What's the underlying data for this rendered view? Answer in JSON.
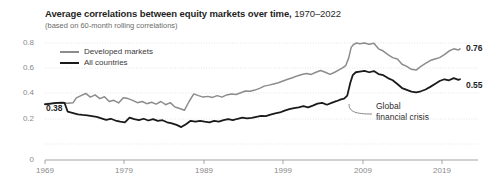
{
  "header": {
    "title_main": "Average correlations between equity markets over time,",
    "title_range": "1970–2022",
    "subtitle": "(based on 60-month rolling correlations)"
  },
  "legend": {
    "position": "top-left-inside",
    "items": [
      {
        "label": "Developed markets",
        "color": "#8c8c8c"
      },
      {
        "label": "All countries",
        "color": "#1a1a1a"
      }
    ]
  },
  "annotations": [
    {
      "name": "global-financial-crisis",
      "line1": "Global",
      "line2": "financial crisis"
    }
  ],
  "value_labels": {
    "start": "0.38",
    "end_developed": "0.76",
    "end_all": "0.55"
  },
  "axes": {
    "y_ticks": [
      "0.8",
      "0.6",
      "0.4",
      "0.2",
      "0"
    ],
    "x_ticks": [
      "1969",
      "1979",
      "1989",
      "1999",
      "2009",
      "2019"
    ]
  },
  "chart_data": {
    "type": "line",
    "title": "Average correlations between equity markets over time, 1970–2022",
    "subtitle": "(based on 60-month rolling correlations)",
    "xlabel": "",
    "ylabel": "",
    "xlim": [
      1969,
      2022
    ],
    "ylim": [
      0,
      0.8
    ],
    "grid": true,
    "legend_position": "upper left",
    "x_ticks": [
      1969,
      1979,
      1989,
      1999,
      2009,
      2019
    ],
    "y_ticks": [
      0,
      0.2,
      0.4,
      0.6,
      0.8
    ],
    "series": [
      {
        "name": "Developed markets",
        "color": "#8c8c8c",
        "x": [
          1969.0,
          1969.8,
          1970.5,
          1971.2,
          1971.9,
          1972.6,
          1973.0,
          1973.6,
          1974.2,
          1974.8,
          1975.4,
          1976.0,
          1976.6,
          1977.2,
          1977.8,
          1978.4,
          1979.0,
          1979.6,
          1980.2,
          1980.8,
          1981.4,
          1982.0,
          1982.6,
          1983.2,
          1983.8,
          1984.4,
          1985.0,
          1985.6,
          1986.2,
          1986.8,
          1987.4,
          1988.0,
          1988.6,
          1989.2,
          1989.8,
          1990.4,
          1991.0,
          1991.6,
          1992.2,
          1992.8,
          1993.4,
          1994.0,
          1994.6,
          1995.2,
          1995.8,
          1996.4,
          1997.0,
          1997.6,
          1998.2,
          1998.8,
          1999.4,
          2000.0,
          2000.6,
          2001.2,
          2001.8,
          2002.4,
          2003.0,
          2003.6,
          2004.2,
          2004.8,
          2005.4,
          2006.0,
          2006.6,
          2007.0,
          2007.4,
          2007.8,
          2008.1,
          2008.4,
          2008.8,
          2009.2,
          2009.8,
          2010.4,
          2011.0,
          2011.6,
          2012.2,
          2012.8,
          2013.4,
          2014.0,
          2014.6,
          2015.2,
          2015.8,
          2016.4,
          2017.0,
          2017.6,
          2018.2,
          2018.8,
          2019.4,
          2020.0,
          2020.6,
          2021.2,
          2021.8,
          2022.0
        ],
        "y": [
          0.385,
          0.388,
          0.392,
          0.39,
          0.388,
          0.392,
          0.425,
          0.44,
          0.455,
          0.43,
          0.445,
          0.42,
          0.432,
          0.4,
          0.408,
          0.39,
          0.425,
          0.42,
          0.408,
          0.392,
          0.4,
          0.385,
          0.395,
          0.382,
          0.4,
          0.378,
          0.392,
          0.362,
          0.352,
          0.34,
          0.4,
          0.452,
          0.44,
          0.43,
          0.435,
          0.428,
          0.44,
          0.43,
          0.445,
          0.452,
          0.448,
          0.46,
          0.472,
          0.47,
          0.478,
          0.49,
          0.505,
          0.512,
          0.52,
          0.528,
          0.54,
          0.552,
          0.562,
          0.575,
          0.585,
          0.592,
          0.585,
          0.6,
          0.612,
          0.6,
          0.585,
          0.6,
          0.618,
          0.63,
          0.645,
          0.7,
          0.77,
          0.79,
          0.8,
          0.795,
          0.8,
          0.792,
          0.798,
          0.76,
          0.745,
          0.72,
          0.7,
          0.69,
          0.655,
          0.64,
          0.62,
          0.615,
          0.64,
          0.66,
          0.68,
          0.69,
          0.7,
          0.72,
          0.745,
          0.76,
          0.752,
          0.76
        ]
      },
      {
        "name": "All countries",
        "color": "#1a1a1a",
        "x": [
          1969.0,
          1969.8,
          1970.5,
          1971.2,
          1971.5,
          1971.9,
          1972.6,
          1973.2,
          1973.8,
          1974.4,
          1975.0,
          1975.6,
          1976.2,
          1976.8,
          1977.4,
          1978.0,
          1978.6,
          1979.2,
          1979.8,
          1980.4,
          1981.0,
          1981.6,
          1982.2,
          1982.8,
          1983.4,
          1984.0,
          1984.6,
          1985.2,
          1985.8,
          1986.4,
          1987.0,
          1987.6,
          1988.2,
          1988.8,
          1989.4,
          1990.0,
          1990.6,
          1991.2,
          1991.8,
          1992.4,
          1993.0,
          1993.6,
          1994.2,
          1994.8,
          1995.4,
          1996.0,
          1996.6,
          1997.2,
          1997.8,
          1998.4,
          1999.0,
          1999.6,
          2000.2,
          2000.8,
          2001.4,
          2002.0,
          2002.6,
          2003.2,
          2003.8,
          2004.4,
          2005.0,
          2005.6,
          2006.2,
          2006.8,
          2007.2,
          2007.6,
          2008.0,
          2008.3,
          2008.7,
          2009.2,
          2009.8,
          2010.4,
          2011.0,
          2011.6,
          2012.2,
          2012.8,
          2013.4,
          2014.0,
          2014.6,
          2015.2,
          2015.8,
          2016.4,
          2017.0,
          2017.6,
          2018.2,
          2018.8,
          2019.4,
          2020.0,
          2020.6,
          2021.2,
          2021.8,
          2022.0
        ],
        "y": [
          0.38,
          0.385,
          0.39,
          0.392,
          0.39,
          0.33,
          0.32,
          0.312,
          0.308,
          0.305,
          0.3,
          0.295,
          0.285,
          0.275,
          0.282,
          0.27,
          0.262,
          0.258,
          0.29,
          0.28,
          0.272,
          0.282,
          0.27,
          0.28,
          0.268,
          0.272,
          0.258,
          0.25,
          0.24,
          0.225,
          0.245,
          0.268,
          0.262,
          0.268,
          0.262,
          0.258,
          0.268,
          0.262,
          0.272,
          0.28,
          0.272,
          0.282,
          0.29,
          0.285,
          0.288,
          0.295,
          0.302,
          0.3,
          0.31,
          0.318,
          0.325,
          0.338,
          0.348,
          0.355,
          0.36,
          0.368,
          0.36,
          0.372,
          0.385,
          0.39,
          0.378,
          0.39,
          0.402,
          0.415,
          0.42,
          0.44,
          0.53,
          0.58,
          0.6,
          0.605,
          0.61,
          0.6,
          0.608,
          0.588,
          0.58,
          0.56,
          0.545,
          0.52,
          0.492,
          0.48,
          0.468,
          0.462,
          0.47,
          0.482,
          0.5,
          0.52,
          0.54,
          0.552,
          0.545,
          0.56,
          0.548,
          0.552
        ]
      }
    ]
  }
}
